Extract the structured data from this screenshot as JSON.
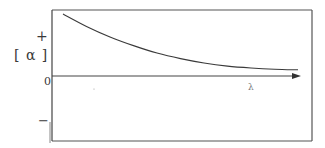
{
  "chart_data": {
    "type": "line",
    "title": "",
    "xlabel": "λ",
    "ylabel": "[α]",
    "y_ticks": [
      "+",
      "0",
      "−"
    ],
    "grid": false,
    "legend": null,
    "series": [
      {
        "name": "[α] vs λ",
        "description": "Monotonic plain positive dispersion curve decaying toward zero as wavelength increases",
        "x": [
          0.0,
          0.1,
          0.2,
          0.3,
          0.4,
          0.5,
          0.6,
          0.7,
          0.8,
          0.9,
          1.0
        ],
        "y": [
          1.0,
          0.8,
          0.63,
          0.49,
          0.37,
          0.28,
          0.21,
          0.16,
          0.13,
          0.11,
          0.1
        ]
      }
    ],
    "xlim": [
      0,
      1
    ],
    "ylim": [
      -1,
      1.05
    ]
  },
  "labels": {
    "y_axis": "[ α ]",
    "plus": "+",
    "zero": "0",
    "minus": "−",
    "x_axis": "λ"
  },
  "colors": {
    "line": "#3a3a3a",
    "frame": "#444444"
  }
}
